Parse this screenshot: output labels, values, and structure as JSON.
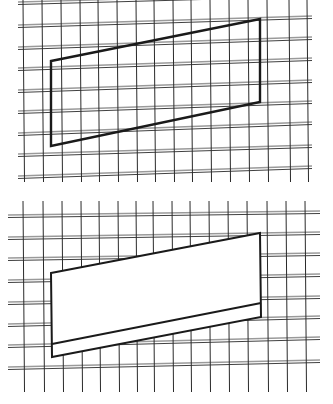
{
  "figures": [
    {
      "name": "top-grid-figure",
      "grid": {
        "vertical_lines": {
          "xs": [
            23,
            42,
            61,
            80,
            98,
            117,
            136,
            154,
            173,
            191,
            210,
            229,
            248,
            267,
            289,
            307
          ],
          "y_top": 0,
          "y_bottom": 182,
          "slope_dx": 1.5
        },
        "horizontal_lines": {
          "left_x": 18,
          "right_x": 312,
          "rows": [
            {
              "y_left": 2,
              "y_right": -6
            },
            {
              "y_left": 25,
              "y_right": 16
            },
            {
              "y_left": 47,
              "y_right": 37
            },
            {
              "y_left": 68,
              "y_right": 58
            },
            {
              "y_left": 90,
              "y_right": 80
            },
            {
              "y_left": 111,
              "y_right": 101
            },
            {
              "y_left": 133,
              "y_right": 122
            },
            {
              "y_left": 154,
              "y_right": 145
            },
            {
              "y_left": 176,
              "y_right": 166
            }
          ],
          "gap": 2.5
        }
      },
      "shapes": [
        {
          "name": "parallelogram",
          "points": [
            [
              51,
              61
            ],
            [
              260,
              19
            ],
            [
              260,
              102
            ],
            [
              51,
              146
            ]
          ],
          "stroke": "#1a1a1a",
          "stroke_width": 2.4,
          "fill": "none"
        }
      ]
    },
    {
      "name": "bottom-grid-figure",
      "grid": {
        "vertical_lines": {
          "xs": [
            23,
            43,
            62,
            81,
            99,
            118,
            136,
            153,
            172,
            190,
            209,
            228,
            247,
            267,
            286,
            305
          ],
          "y_top": 201,
          "y_bottom": 392,
          "slope_dx": 1.5
        },
        "horizontal_lines": {
          "left_x": 8,
          "right_x": 320,
          "rows": [
            {
              "y_left": 215,
              "y_right": 211
            },
            {
              "y_left": 237,
              "y_right": 232
            },
            {
              "y_left": 258,
              "y_right": 253
            },
            {
              "y_left": 280,
              "y_right": 274
            },
            {
              "y_left": 302,
              "y_right": 296
            },
            {
              "y_left": 324,
              "y_right": 316
            },
            {
              "y_left": 345,
              "y_right": 337
            },
            {
              "y_left": 367,
              "y_right": 360
            }
          ],
          "gap": 2.5
        },
        "mask": {
          "points": [
            [
              51,
              273
            ],
            [
              260,
              233
            ],
            [
              260,
              317
            ],
            [
              52,
              357
            ]
          ],
          "fill": "#ffffff"
        }
      },
      "shapes": [
        {
          "name": "outer-parallelogram",
          "points": [
            [
              51,
              273
            ],
            [
              260,
              233
            ],
            [
              261,
              317
            ],
            [
              52,
              357
            ]
          ],
          "stroke": "#1a1a1a",
          "stroke_width": 2,
          "fill": "none"
        },
        {
          "name": "inner-slanted-line",
          "points": [
            [
              52,
              344
            ],
            [
              261,
              303
            ]
          ],
          "stroke": "#1a1a1a",
          "stroke_width": 1.8,
          "fill": "none"
        }
      ]
    }
  ],
  "colors": {
    "background": "#ffffff",
    "grid_dark": "#2a2a2a",
    "grid_light": "#9a9a9a",
    "shape_stroke": "#1a1a1a"
  }
}
